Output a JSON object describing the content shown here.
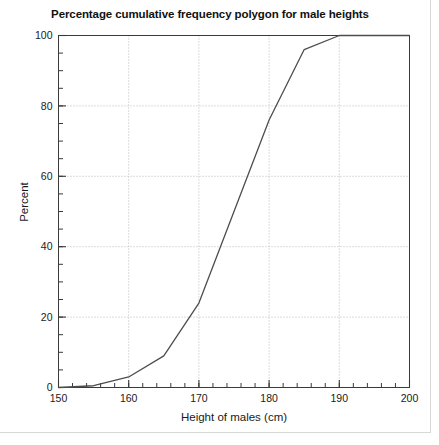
{
  "chart_data": {
    "type": "line",
    "title": "Percentage cumulative frequency polygon for male heights",
    "xlabel": "Height of males (cm)",
    "ylabel": "Percent",
    "xlim": [
      150,
      200
    ],
    "ylim": [
      0,
      100
    ],
    "x_major_ticks": [
      150,
      160,
      170,
      180,
      190,
      200
    ],
    "x_tick_labels": [
      "150",
      "160",
      "170",
      "180",
      "190",
      "200"
    ],
    "x_minor_step": 2,
    "y_major_ticks": [
      0,
      20,
      40,
      60,
      80,
      100
    ],
    "y_tick_labels": [
      "0",
      "20",
      "40",
      "60",
      "80",
      "100"
    ],
    "y_minor_step": 5,
    "grid": "dotted major gridlines at x=160,170,180,190 and y=20,40,60,80",
    "legend": "none",
    "line_color": "#4d4d4d",
    "series": [
      {
        "name": "Cumulative percentage",
        "x": [
          150,
          155,
          160,
          165,
          170,
          175,
          180,
          185,
          190,
          200
        ],
        "values": [
          0,
          0.5,
          3,
          9,
          24,
          50,
          76,
          96,
          100,
          100
        ]
      }
    ]
  },
  "figure": {
    "title": "Percentage cumulative frequency polygon for male heights",
    "xlabel": "Height of males (cm)",
    "ylabel": "Percent"
  }
}
